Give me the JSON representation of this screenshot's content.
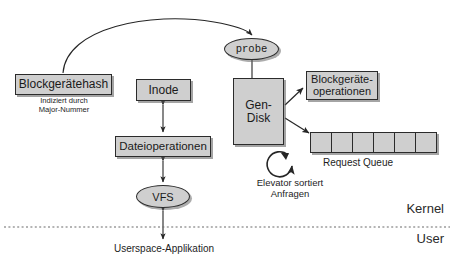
{
  "diagram": {
    "colors": {
      "node_fill": "#cfcfcf",
      "node_stroke": "#2b2b2b",
      "text": "#1a1a1a",
      "background": "#ffffff",
      "divider": "#6b6b6b"
    },
    "nodes": [
      {
        "id": "blockgeraetehash",
        "label": "Blockgerätehash",
        "shape": "box"
      },
      {
        "id": "inode",
        "label": "Inode",
        "shape": "box"
      },
      {
        "id": "dateioperationen",
        "label": "Dateioperationen",
        "shape": "box"
      },
      {
        "id": "gendisk",
        "label": "Gen-\nDisk",
        "shape": "box"
      },
      {
        "id": "blockgeraeteoperationen",
        "label": "Blockgeräte-\noperationen",
        "shape": "box"
      },
      {
        "id": "probe",
        "label": "probe",
        "shape": "ellipse"
      },
      {
        "id": "vfs",
        "label": "VFS",
        "shape": "ellipse"
      }
    ],
    "captions": [
      {
        "id": "hash-index",
        "text": "Indiziert durch\nMajor-Nummer"
      },
      {
        "id": "elevator",
        "text": "Elevator sortiert\nAnfragen"
      },
      {
        "id": "request-queue",
        "text": "Request Queue"
      },
      {
        "id": "userspace",
        "text": "Userspace-Applikation"
      }
    ],
    "zone_labels": [
      {
        "id": "kernel",
        "text": "Kernel"
      },
      {
        "id": "user",
        "text": "User"
      }
    ],
    "request_queue": {
      "label": "Request Queue",
      "cell_count": 6,
      "cell_width": 22
    },
    "edges": [
      {
        "from": "blockgeraetehash",
        "to": "probe",
        "style": "curved-arrow"
      },
      {
        "from": "probe",
        "to": "gendisk",
        "style": "plain-line"
      },
      {
        "from": "inode",
        "to": "dateioperationen",
        "style": "double-arrow"
      },
      {
        "from": "dateioperationen",
        "to": "vfs",
        "style": "double-arrow"
      },
      {
        "from": "vfs",
        "to": "userspace",
        "style": "double-arrow"
      },
      {
        "from": "gendisk",
        "to": "blockgeraeteoperationen",
        "style": "arrow"
      },
      {
        "from": "gendisk",
        "to": "request-queue",
        "style": "arrow"
      }
    ]
  }
}
